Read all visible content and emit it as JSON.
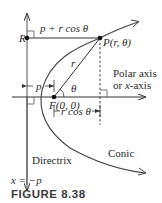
{
  "figure": {
    "caption": "FIGURE 8.38",
    "colors": {
      "line": "#333333",
      "curve": "#444444",
      "text": "#2a2a2a",
      "background": "#ffffff"
    }
  },
  "labels": {
    "R": "R",
    "distance_top": "p + r cos θ",
    "P": "P(r, θ)",
    "r": "r",
    "theta": "θ",
    "polar_axis_line1": "Polar axis",
    "polar_axis_line2": "or x-axis",
    "p": "p",
    "F": "F(0, 0)",
    "rcos": "r cos θ",
    "directrix": "Directrix",
    "conic": "Conic",
    "directrix_eq": "x = −p"
  },
  "points": {
    "R": [
      27,
      38
    ],
    "P": [
      100,
      38
    ],
    "F": [
      54,
      97
    ]
  }
}
